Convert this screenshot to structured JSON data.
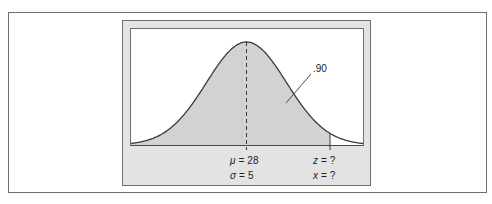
{
  "figure": {
    "type": "normal-distribution-diagram",
    "shaded_area_label": ".90",
    "mean_label": {
      "symbol": "μ",
      "value": "28",
      "text": "μ = 28"
    },
    "sd_label": {
      "symbol": "σ",
      "value": "5",
      "text": "σ = 5"
    },
    "z_label": {
      "symbol": "z",
      "value": "?",
      "text": "z = ?"
    },
    "x_label": {
      "symbol": "x",
      "value": "?",
      "text": "x = ?"
    },
    "colors": {
      "panel": "#e3e3e3",
      "shade": "#d2d2d2",
      "curve": "#3a3a3a",
      "border": "#6e6e6e"
    }
  },
  "chart_data": {
    "type": "area",
    "title": "",
    "distribution": "normal",
    "mean": 28,
    "sd": 5,
    "shaded_region": "left of x",
    "shaded_area": 0.9,
    "annotations": [
      ".90",
      "μ = 28",
      "σ = 5",
      "z = ?",
      "x = ?"
    ],
    "xlabel": "",
    "ylabel": "",
    "grid": false
  }
}
